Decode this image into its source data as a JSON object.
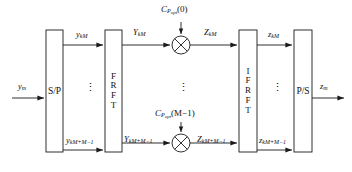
{
  "figure": {
    "type": "block-diagram",
    "background_color": "#ffffff",
    "line_color": "#1a1a1a"
  },
  "blocks": [
    {
      "id": "sp",
      "label": "S/P",
      "letters": [
        "S/P"
      ],
      "x": 46,
      "y": 30,
      "w": 17,
      "h": 122
    },
    {
      "id": "frft",
      "label": "FRFT",
      "letters": [
        "F",
        "R",
        "F",
        "T"
      ],
      "x": 105,
      "y": 30,
      "w": 17,
      "h": 122
    },
    {
      "id": "ifrft",
      "label": "IFRFT",
      "letters": [
        "I",
        "F",
        "R",
        "F",
        "T"
      ],
      "x": 239,
      "y": 30,
      "w": 18,
      "h": 122
    },
    {
      "id": "ps",
      "label": "P/S",
      "letters": [
        "P/S"
      ],
      "x": 294,
      "y": 30,
      "w": 18,
      "h": 122
    }
  ],
  "multipliers": [
    {
      "id": "mult-top",
      "symbol": "×",
      "cx": 181,
      "cy": 45,
      "r": 9
    },
    {
      "id": "mult-bottom",
      "symbol": "×",
      "cx": 181,
      "cy": 143,
      "r": 9
    }
  ],
  "coefficients": [
    {
      "id": "coef-0",
      "base": "C",
      "sub": "P",
      "sub_sub": "opt",
      "arg": "(0)",
      "x": 160,
      "y": 6
    },
    {
      "id": "coef-m1",
      "base": "C",
      "sub": "P",
      "sub_sub": "opt",
      "arg": "(M−1)",
      "x": 155,
      "y": 110
    }
  ],
  "signals": [
    {
      "id": "input-ym",
      "base": "y",
      "sub": "m",
      "x": 18,
      "y": 88
    },
    {
      "id": "y-km",
      "base": "y",
      "sub": "kM",
      "x": 76,
      "y": 30
    },
    {
      "id": "y-km-m1",
      "base": "y",
      "sub": "kM+M−1",
      "x": 68,
      "y": 139
    },
    {
      "id": "Y-km",
      "base": "Y",
      "sub": "kM",
      "x": 133,
      "y": 28
    },
    {
      "id": "Y-km-m1",
      "base": "Y",
      "sub": "kM+M−1",
      "x": 126,
      "y": 138
    },
    {
      "id": "Z-km",
      "base": "Z",
      "sub": "kM",
      "x": 204,
      "y": 28
    },
    {
      "id": "Z-km-m1",
      "base": "Z",
      "sub": "kM+M−1",
      "x": 199,
      "y": 138
    },
    {
      "id": "z-km",
      "base": "z",
      "sub": "kM",
      "x": 270,
      "y": 30
    },
    {
      "id": "z-km-m1",
      "base": "z",
      "sub": "kM+M−1",
      "x": 262,
      "y": 139
    },
    {
      "id": "output-zm",
      "base": "z",
      "sub": "m",
      "x": 322,
      "y": 88
    }
  ],
  "ellipses": [
    {
      "id": "dots-sp-frft",
      "glyph": "⋮",
      "x": 88,
      "y": 82
    },
    {
      "id": "dots-mult",
      "glyph": "⋮",
      "x": 178,
      "y": 82
    },
    {
      "id": "dots-ifrft-ps",
      "glyph": "⋮",
      "x": 273,
      "y": 82
    }
  ]
}
